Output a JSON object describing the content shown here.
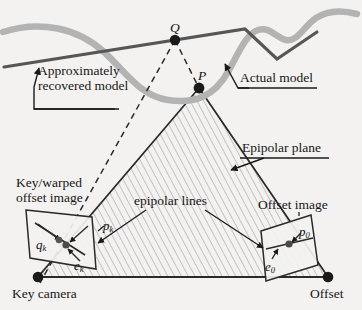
{
  "figure": {
    "background_color": "#f3f2f0",
    "ink_color": "#1a1a1a",
    "actual_model_color": "#b0b0b0",
    "recovered_model_color": "#5a5a5a",
    "hatch_color": "#a9a9a9"
  },
  "labels": {
    "approx_recovered_line1": "Approximately",
    "approx_recovered_line2": "recovered model",
    "actual_model": "Actual model",
    "epipolar_plane": "Epipolar plane",
    "epipolar_lines": "epipolar lines",
    "key_warped_line1": "Key/warped",
    "key_warped_line2": "offset image",
    "offset_image": "Offset image",
    "key_camera": "Key camera",
    "offset_camera": "Offset"
  },
  "math_labels": {
    "point_Q": "Q",
    "point_P": "P",
    "q_k_base": "q",
    "q_k_sub": "k",
    "p_k_base": "p",
    "p_k_sub": "k",
    "e_k_base": "e",
    "e_k_sub": "k",
    "p_0_base": "p",
    "p_0_sub": "0",
    "e_0_base": "e",
    "e_0_sub": "0"
  },
  "geometry": {
    "point_Q": {
      "x": 175,
      "y": 40
    },
    "point_P": {
      "x": 199,
      "y": 88
    },
    "key_camera": {
      "x": 38,
      "y": 277
    },
    "offset_camera": {
      "x": 328,
      "y": 277
    },
    "key_image_point": {
      "x": 63,
      "y": 243
    },
    "offset_image_point": {
      "x": 289,
      "y": 243
    }
  }
}
